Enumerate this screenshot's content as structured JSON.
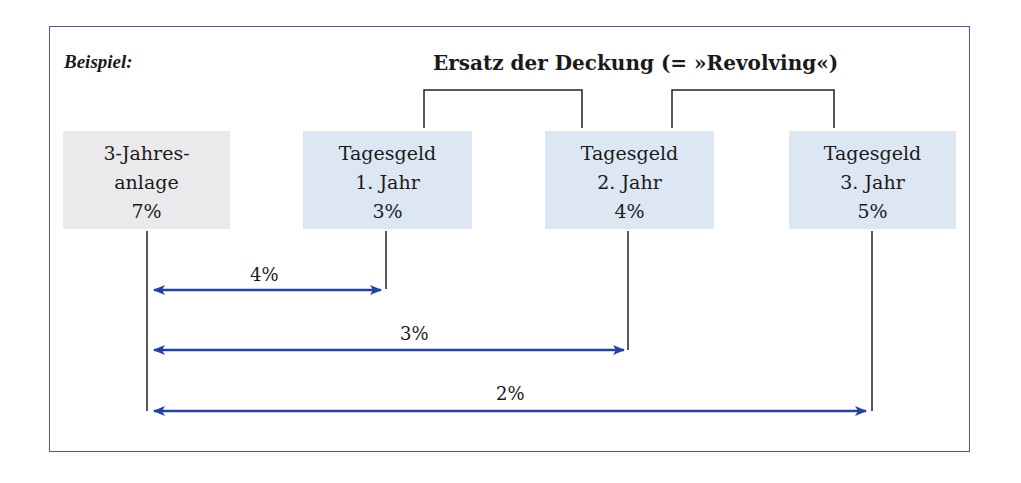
{
  "example_label": "Beispiel:",
  "title": "Ersatz der Deckung (= »Revolving«)",
  "boxes": [
    {
      "line1": "3-Jahres-",
      "line2": "anlage",
      "rate": "7%",
      "color": "#eaeaec"
    },
    {
      "line1": "Tagesgeld",
      "line2": "1. Jahr",
      "rate": "3%",
      "color": "#dde6f3"
    },
    {
      "line1": "Tagesgeld",
      "line2": "2. Jahr",
      "rate": "4%",
      "color": "#dde6f3"
    },
    {
      "line1": "Tagesgeld",
      "line2": "3. Jahr",
      "rate": "5%",
      "color": "#dde6f3"
    }
  ],
  "spreads": [
    {
      "label": "4%",
      "from": "3-Jahresanlage",
      "to": "Tagesgeld 1. Jahr"
    },
    {
      "label": "3%",
      "from": "3-Jahresanlage",
      "to": "Tagesgeld 2. Jahr"
    },
    {
      "label": "2%",
      "from": "3-Jahresanlage",
      "to": "Tagesgeld 3. Jahr"
    }
  ],
  "colors": {
    "frame": "#4a55b0",
    "arrow": "#2340a8",
    "connector": "#222222"
  }
}
